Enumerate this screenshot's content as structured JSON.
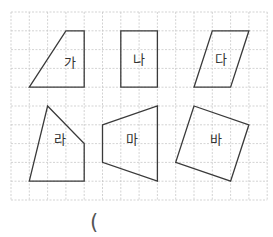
{
  "grid": {
    "origin_px": [
      11,
      12
    ],
    "cell_w": 18.3,
    "cell_h": 18.8,
    "cols": 14,
    "rows": 10,
    "line_color": "#c8c8c8"
  },
  "shapes": [
    {
      "id": "ga",
      "label": "가",
      "vertices": [
        [
          1,
          4
        ],
        [
          3,
          1
        ],
        [
          4,
          1
        ],
        [
          4,
          4
        ]
      ],
      "label_pos": [
        3.2,
        2.7
      ]
    },
    {
      "id": "na",
      "label": "나",
      "vertices": [
        [
          6,
          1
        ],
        [
          8,
          1
        ],
        [
          8,
          4
        ],
        [
          6,
          4
        ]
      ],
      "label_pos": [
        7,
        2.5
      ]
    },
    {
      "id": "da",
      "label": "다",
      "vertices": [
        [
          10,
          4
        ],
        [
          11,
          1
        ],
        [
          13,
          1
        ],
        [
          12,
          4
        ]
      ],
      "label_pos": [
        11.5,
        2.5
      ]
    },
    {
      "id": "ra",
      "label": "라",
      "vertices": [
        [
          2,
          5
        ],
        [
          4,
          7
        ],
        [
          4,
          9
        ],
        [
          1,
          9
        ]
      ],
      "label_pos": [
        2.7,
        6.8
      ]
    },
    {
      "id": "ma",
      "label": "마",
      "vertices": [
        [
          5,
          6
        ],
        [
          8,
          5
        ],
        [
          8,
          9
        ],
        [
          5,
          8
        ]
      ],
      "label_pos": [
        6.6,
        6.8
      ]
    },
    {
      "id": "ba",
      "label": "바",
      "vertices": [
        [
          10,
          5
        ],
        [
          13,
          6
        ],
        [
          12,
          9
        ],
        [
          9,
          8
        ]
      ],
      "label_pos": [
        11.2,
        6.8
      ]
    }
  ],
  "stroke_color": "#3a3a3a",
  "answer": {
    "open_paren": "("
  }
}
